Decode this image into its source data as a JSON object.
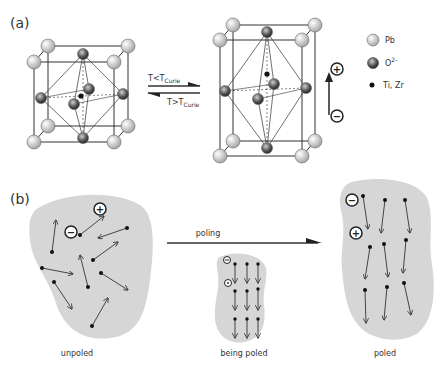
{
  "panel_a": {
    "label": "(a)",
    "transition_forward": "T<T",
    "transition_forward_sub": "Curie",
    "transition_backward": "T>T",
    "transition_backward_sub": "Curie",
    "polarity_plus": "+",
    "polarity_minus": "−",
    "legend": [
      {
        "name": "Pb",
        "symbol": "light-sphere"
      },
      {
        "name": "O",
        "sup": "2-",
        "symbol": "dark-sphere"
      },
      {
        "name": "Ti, Zr",
        "symbol": "black-dot"
      }
    ]
  },
  "panel_b": {
    "label": "(b)",
    "arrow_label": "poling",
    "states": [
      {
        "caption": "unpoled"
      },
      {
        "caption": "being poled"
      },
      {
        "caption": "poled"
      }
    ],
    "plus": "+",
    "minus": "−"
  },
  "colors": {
    "grain": "#d6d6d6",
    "line": "#333333",
    "pb": "#e6e6e6",
    "oxygen": "#555555"
  }
}
